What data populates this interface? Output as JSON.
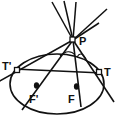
{
  "figure": {
    "background_color": "#ffffff",
    "stroke_color": "#111111",
    "labels": {
      "point_p": "P",
      "point_t": "T",
      "point_t_prime": "T'",
      "focus_f": "F",
      "focus_f_prime": "F'"
    }
  },
  "geometry": {
    "ellipse": {
      "center_x": 57,
      "center_y": 84,
      "radius_x": 47,
      "radius_y": 30
    },
    "points": {
      "P": {
        "x": 73,
        "y": 40,
        "marker": "open-square"
      },
      "T": {
        "x": 99,
        "y": 72,
        "marker": "open-square"
      },
      "T_prime": {
        "x": 17,
        "y": 70,
        "marker": "open-square"
      },
      "F": {
        "x": 76,
        "y": 87,
        "marker": "filled-dot"
      },
      "F_prime": {
        "x": 37,
        "y": 86,
        "marker": "filled-dot"
      }
    },
    "label_positions": {
      "P": {
        "x": 79,
        "y": 43
      },
      "T": {
        "x": 104,
        "y": 74
      },
      "T_prime": {
        "x": 4,
        "y": 68
      },
      "F": {
        "x": 70,
        "y": 101
      },
      "F_prime": {
        "x": 31,
        "y": 101
      }
    },
    "tangent_lines": [
      {
        "name": "tangent-p-to-t",
        "x1": 73,
        "y1": 40,
        "x2": 113,
        "y2": 100
      },
      {
        "name": "tangent-p-to-t-prime",
        "x1": 73,
        "y1": 40,
        "x2": 0,
        "y2": 81
      }
    ],
    "focal_lines": [
      {
        "name": "focal-line-p-to-f",
        "x1": 73,
        "y1": 40,
        "x2": 80,
        "y2": 104
      },
      {
        "name": "focal-line-p-to-f-prime",
        "x1": 73,
        "y1": 40,
        "x2": 24,
        "y2": 107
      }
    ],
    "upper_rays": [
      {
        "name": "ray-up-left",
        "x2": 53,
        "y2": 2
      },
      {
        "name": "ray-up-mid-left",
        "x2": 64,
        "y2": 1
      },
      {
        "name": "ray-up-mid",
        "x2": 75,
        "y2": 3
      },
      {
        "name": "ray-up-right",
        "x2": 106,
        "y2": 10
      },
      {
        "name": "ray-up-far-right",
        "x2": 98,
        "y2": 22
      }
    ],
    "angle_marks": [
      {
        "name": "angle-arc-left",
        "path": "M 62 55 Q 71 49 76 54"
      },
      {
        "name": "angle-arc-right",
        "path": "M 78 56 Q 82 50 86 58"
      }
    ],
    "chord_line": {
      "name": "chord-t-prime-to-t",
      "x1": 17,
      "y1": 70,
      "x2": 99,
      "y2": 72
    }
  }
}
